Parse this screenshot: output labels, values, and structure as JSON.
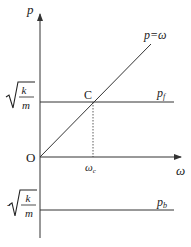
{
  "diagram": {
    "y_axis_label": "p",
    "x_axis_label": "ω",
    "origin_label": "O",
    "diagonal_line_label": "p=ω",
    "upper_line_label": "p",
    "upper_line_subscript": "f",
    "lower_line_label": "p",
    "lower_line_subscript": "b",
    "intersection_label": "C",
    "x_tick_label": "ω",
    "x_tick_subscript": "c",
    "upper_value_label": {
      "prefix": "",
      "numerator": "k",
      "denominator": "m"
    },
    "lower_value_label": {
      "prefix": "-",
      "numerator": "k",
      "denominator": "m"
    },
    "colors": {
      "line": "#333333",
      "background": "#ffffff"
    }
  }
}
